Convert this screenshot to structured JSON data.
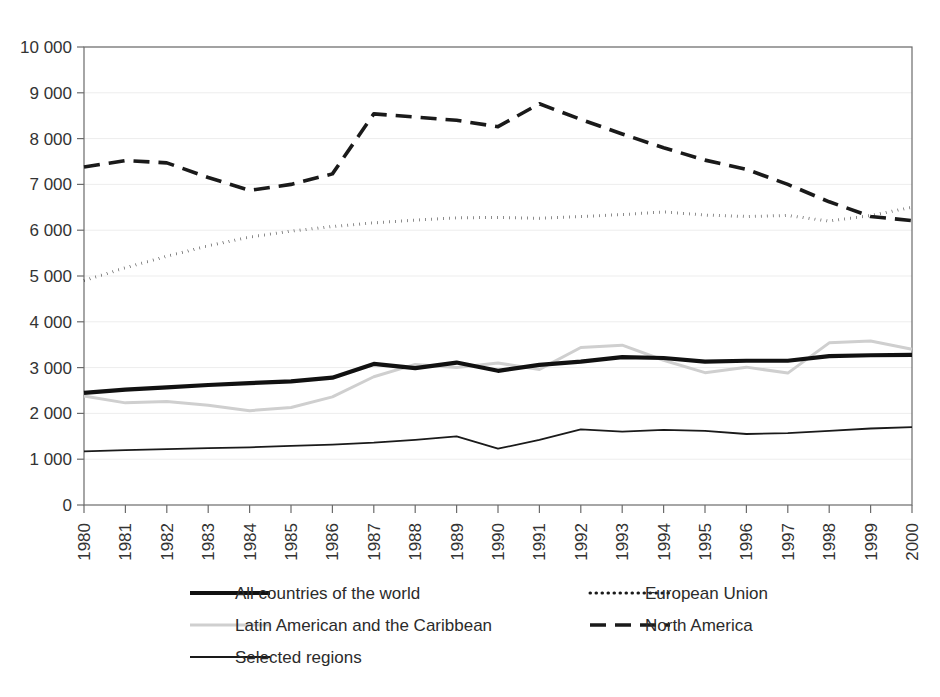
{
  "chart_data": {
    "type": "line",
    "title": "",
    "subtitle": "",
    "xlabel": "",
    "ylabel": "",
    "grid": true,
    "legend_position": "bottom",
    "xlim": [
      1980,
      2000
    ],
    "ylim": [
      0,
      10000
    ],
    "y_ticks": [
      0,
      1000,
      2000,
      3000,
      4000,
      5000,
      6000,
      7000,
      8000,
      9000,
      10000
    ],
    "y_tick_labels": [
      "0",
      "1 000",
      "2 000",
      "3 000",
      "4 000",
      "5 000",
      "6 000",
      "7 000",
      "8 000",
      "9 000",
      "10 000"
    ],
    "categories": [
      1980,
      1981,
      1982,
      1983,
      1984,
      1985,
      1986,
      1987,
      1988,
      1989,
      1990,
      1991,
      1992,
      1993,
      1994,
      1995,
      1996,
      1997,
      1998,
      1999,
      2000
    ],
    "x_tick_labels": [
      "1980",
      "1981",
      "1982",
      "1983",
      "1984",
      "1985",
      "1986",
      "1987",
      "1988",
      "1989",
      "1990",
      "1991",
      "1992",
      "1993",
      "1994",
      "1995",
      "1996",
      "1997",
      "1998",
      "1999",
      "2000"
    ],
    "series": [
      {
        "name": "All countries of the world",
        "key": "all-countries",
        "color": "#111111",
        "width": 4.2,
        "dash": "none",
        "values": [
          2450,
          2520,
          2570,
          2620,
          2660,
          2700,
          2780,
          3080,
          2990,
          3110,
          2930,
          3060,
          3130,
          3230,
          3210,
          3130,
          3150,
          3150,
          3250,
          3270,
          3280
        ]
      },
      {
        "name": "Latin American and the Caribbean",
        "key": "latin-america-caribbean",
        "color": "#cfcfcf",
        "width": 3.0,
        "dash": "none",
        "values": [
          2380,
          2230,
          2260,
          2180,
          2060,
          2130,
          2360,
          2800,
          3070,
          3000,
          3100,
          2960,
          3440,
          3490,
          3160,
          2890,
          3010,
          2880,
          3540,
          3580,
          3400
        ]
      },
      {
        "name": "Selected regions",
        "key": "selected-regions",
        "color": "#1a1a1a",
        "width": 1.8,
        "dash": "none",
        "values": [
          1170,
          1200,
          1220,
          1240,
          1260,
          1290,
          1320,
          1360,
          1420,
          1500,
          1230,
          1420,
          1650,
          1600,
          1640,
          1620,
          1550,
          1570,
          1620,
          1670,
          1700
        ]
      },
      {
        "name": "European Union",
        "key": "european-union",
        "color": "#1a1a1a",
        "width": 3.0,
        "dash": "0.5,5.5",
        "values": [
          4900,
          5180,
          5430,
          5660,
          5850,
          5980,
          6080,
          6160,
          6220,
          6270,
          6280,
          6260,
          6300,
          6340,
          6400,
          6330,
          6300,
          6320,
          6200,
          6320,
          6500
        ]
      },
      {
        "name": "North America",
        "key": "north-america",
        "color": "#1a1a1a",
        "width": 3.6,
        "dash": "16,9",
        "values": [
          7380,
          7520,
          7470,
          7150,
          6870,
          7000,
          7230,
          8540,
          8470,
          8400,
          8260,
          8760,
          8420,
          8100,
          7800,
          7530,
          7330,
          7000,
          6620,
          6300,
          6210
        ]
      }
    ]
  },
  "legend": {
    "items": [
      {
        "label": "All countries of the world",
        "key": "all-countries"
      },
      {
        "label": "European Union",
        "key": "european-union"
      },
      {
        "label": "Latin American and the Caribbean",
        "key": "latin-america-caribbean"
      },
      {
        "label": "North America",
        "key": "north-america"
      },
      {
        "label": "Selected regions",
        "key": "selected-regions"
      }
    ]
  }
}
